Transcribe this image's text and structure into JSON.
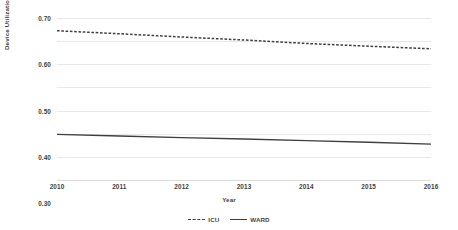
{
  "chart_data": {
    "type": "line",
    "title": "",
    "xlabel": "Year",
    "ylabel": "Device Utilization Ratio",
    "categories": [
      "2010",
      "2011",
      "2012",
      "2013",
      "2014",
      "2015",
      "2016"
    ],
    "x": [
      2010,
      2011,
      2012,
      2013,
      2014,
      2015,
      2016
    ],
    "xlim": [
      2010,
      2016
    ],
    "ylim": [
      0.0,
      0.7
    ],
    "yticks": [
      "0.00",
      "0.10",
      "0.20",
      "0.30",
      "0.40",
      "0.50",
      "0.60",
      "0.70"
    ],
    "ytick_values": [
      0.0,
      0.1,
      0.2,
      0.3,
      0.4,
      0.5,
      0.6,
      0.7
    ],
    "grid": true,
    "legend_position": "bottom",
    "series": [
      {
        "name": "ICU",
        "style": "dashed",
        "color": "#3f3f3f",
        "values": [
          0.645,
          0.632,
          0.618,
          0.605,
          0.59,
          0.578,
          0.567
        ]
      },
      {
        "name": "WARD",
        "style": "solid",
        "color": "#3f3f3f",
        "values": [
          0.197,
          0.19,
          0.183,
          0.177,
          0.17,
          0.163,
          0.155
        ]
      }
    ]
  },
  "axis": {
    "y_title": "Device Utilization Ratio",
    "x_title": "Year"
  },
  "legend": {
    "items": [
      {
        "label": "ICU",
        "style": "dashed"
      },
      {
        "label": "WARD",
        "style": "solid"
      }
    ]
  },
  "colors": {
    "line": "#3f3f3f",
    "gridline": "#e8e8e8",
    "text": "#3f3f3f",
    "background": "#ffffff"
  }
}
